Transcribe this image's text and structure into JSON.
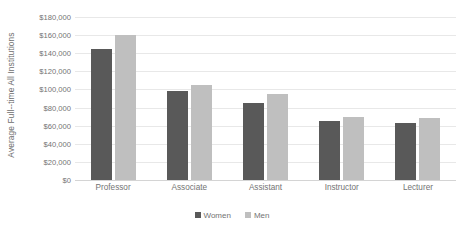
{
  "chart_data": {
    "type": "bar",
    "title": "",
    "subtitle": "",
    "xlabel": "",
    "ylabel": "Average Full--time All Institutions",
    "categories": [
      "Professor",
      "Associate",
      "Assistant",
      "Instructor",
      "Lecturer"
    ],
    "series": [
      {
        "name": "Women",
        "color": "#595959",
        "values": [
          145000,
          98000,
          85000,
          65000,
          63000
        ]
      },
      {
        "name": "Men",
        "color": "#bfbfbf",
        "values": [
          160000,
          105000,
          95000,
          70000,
          68000
        ]
      }
    ],
    "ylim": [
      0,
      180000
    ],
    "ytick_values": [
      180000,
      160000,
      140000,
      120000,
      100000,
      80000,
      60000,
      40000,
      20000,
      0
    ],
    "ytick_labels": [
      "$180,000",
      "$160,000",
      "$140,000",
      "$120,000",
      "$100,000",
      "$80,000",
      "$60,000",
      "$40,000",
      "$20,000",
      "$0"
    ],
    "grid": true,
    "grid_axis": "y",
    "legend_position": "bottom",
    "legend_entries": [
      "Women",
      "Men"
    ],
    "annotations": [],
    "colors": {
      "grid": "#e8e8e8",
      "axis": "#d4d4d4",
      "tick_text": "#737373",
      "axis_title_text": "#6d6d6d",
      "background": "#ffffff"
    }
  }
}
